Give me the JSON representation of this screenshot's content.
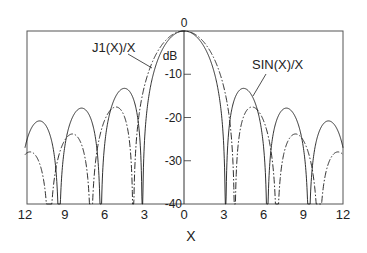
{
  "chart_data": {
    "type": "line",
    "title": "",
    "xlabel": "X",
    "ylabel": "dB",
    "xlim": [
      -12,
      12
    ],
    "ylim": [
      -40,
      0
    ],
    "x_ticks": [
      -12,
      -9,
      -6,
      -3,
      0,
      3,
      6,
      9,
      12
    ],
    "x_tick_labels": [
      "12",
      "9",
      "6",
      "3",
      "0",
      "3",
      "6",
      "9",
      "12"
    ],
    "y_ticks": [
      0,
      -10,
      -20,
      -30,
      -40
    ],
    "y_tick_labels": [
      "0",
      "-10",
      "-20",
      "-30",
      "-40"
    ],
    "grid": false,
    "legend": "inline annotations",
    "symmetric_about_zero": true,
    "x": [
      0,
      0.5,
      1,
      1.5,
      2,
      2.5,
      3,
      3.5,
      4,
      4.5,
      5,
      5.5,
      6,
      6.5,
      7,
      7.5,
      8,
      8.5,
      9,
      9.5,
      10,
      10.5,
      11,
      11.5,
      12
    ],
    "series": [
      {
        "name": "SIN(X)/X",
        "style": "solid",
        "formula": "sinc",
        "values": [
          0,
          -0.36,
          -1.5,
          -3.54,
          -6.85,
          -12.42,
          -26.55,
          -19.98,
          -14.46,
          -13.26,
          -14.34,
          -17.84,
          -26.64,
          -29.6,
          -20.55,
          -18.06,
          -18.15,
          -20.54,
          -26.78,
          -40,
          -25.29,
          -21.54,
          -20.83,
          -22.37,
          -26.99
        ]
      },
      {
        "name": "J1(X)/X",
        "style": "dash-dot",
        "formula": "jinc",
        "values": [
          0,
          -0.27,
          -1.11,
          -2.57,
          -4.78,
          -8.01,
          -12.91,
          -22.1,
          -29.63,
          -19.77,
          -17.65,
          -18.12,
          -20.7,
          -26.5,
          -40,
          -28.86,
          -24.63,
          -23.84,
          -25.27,
          -29.38,
          -40,
          -36.46,
          -29.86,
          -28.02,
          -28.58
        ]
      }
    ],
    "annotations": [
      {
        "text": "J1(X)/X",
        "target_series": "J1(X)/X"
      },
      {
        "text": "SIN(X)/X",
        "target_series": "SIN(X)/X"
      }
    ]
  },
  "colors": {
    "line": "#1a1a1a",
    "frame": "#555555",
    "background": "#ffffff"
  }
}
